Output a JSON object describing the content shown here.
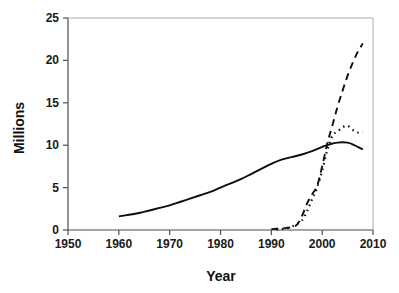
{
  "chart_data": {
    "type": "line",
    "title": "",
    "xlabel": "Year",
    "ylabel": "Millions",
    "xlim": [
      1950,
      2010
    ],
    "ylim": [
      0,
      25
    ],
    "xticks": [
      1950,
      1960,
      1970,
      1980,
      1990,
      2000,
      2010
    ],
    "xtick_labels": [
      "1950",
      "1960",
      "1970",
      "1980",
      "1990",
      "2000",
      "2010"
    ],
    "yticks": [
      0,
      5,
      10,
      15,
      20,
      25
    ],
    "ytick_labels": [
      "0",
      "5",
      "10",
      "15",
      "20",
      "25"
    ],
    "grid": false,
    "legend": "none",
    "frame": "left-bottom",
    "series": [
      {
        "name": "solid-series",
        "style": "solid",
        "color": "#0d0d0d",
        "width": 1.9,
        "dash": "",
        "x": [
          1960,
          1962,
          1964,
          1966,
          1968,
          1970,
          1972,
          1974,
          1976,
          1978,
          1980,
          1982,
          1984,
          1986,
          1988,
          1990,
          1992,
          1994,
          1996,
          1998,
          2000,
          2001,
          2002,
          2003,
          2004,
          2005,
          2006,
          2007,
          2008
        ],
        "values": [
          1.6,
          1.8,
          2.0,
          2.3,
          2.6,
          2.9,
          3.3,
          3.7,
          4.1,
          4.5,
          5.0,
          5.5,
          6.0,
          6.6,
          7.2,
          7.8,
          8.3,
          8.6,
          8.9,
          9.3,
          9.8,
          10.0,
          10.2,
          10.3,
          10.35,
          10.3,
          10.1,
          9.8,
          9.5
        ]
      },
      {
        "name": "dashed-series",
        "style": "dashed",
        "color": "#0d0d0d",
        "width": 1.9,
        "dash": "7,5",
        "x": [
          1990,
          1991,
          1992,
          1993,
          1994,
          1995,
          1996,
          1997,
          1998,
          1999,
          2000,
          2001,
          2002,
          2003,
          2004,
          2005,
          2006,
          2007,
          2008
        ],
        "values": [
          0.1,
          0.15,
          0.2,
          0.25,
          0.35,
          0.6,
          1.6,
          3.1,
          4.2,
          5.2,
          7.5,
          10.2,
          12.3,
          14.5,
          16.4,
          18.2,
          19.7,
          21.0,
          22.0
        ]
      },
      {
        "name": "dotted-series",
        "style": "dotted",
        "color": "#0d0d0d",
        "width": 2.2,
        "dash": "1.5,4",
        "x": [
          1991,
          1992,
          1993,
          1994,
          1995,
          1996,
          1997,
          1998,
          1999,
          2000,
          2001,
          2002,
          2003,
          2004,
          2005,
          2006,
          2007,
          2008
        ],
        "values": [
          0.05,
          0.1,
          0.2,
          0.4,
          0.7,
          1.1,
          2.2,
          3.6,
          5.0,
          7.0,
          9.4,
          11.1,
          11.6,
          12.1,
          12.3,
          11.8,
          11.5,
          11.6
        ]
      }
    ]
  },
  "geometry": {
    "plot_left": 68,
    "plot_right": 373,
    "plot_top": 18,
    "plot_bottom": 230
  }
}
